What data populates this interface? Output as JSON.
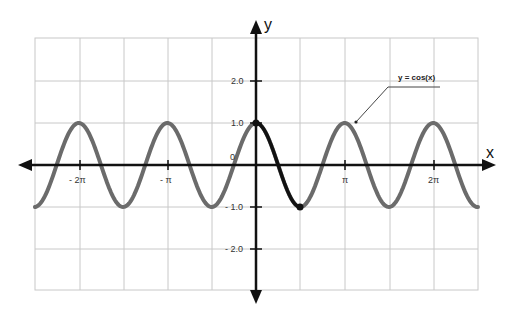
{
  "chart_data": {
    "type": "line",
    "title": "",
    "xlabel": "x",
    "ylabel": "y",
    "x_ticks": [
      "- 2π",
      "- π",
      "π",
      "2π"
    ],
    "y_ticks": [
      "2.0",
      "1.0",
      "0",
      "- 1.0",
      "- 2.0"
    ],
    "xlim_px": [
      35,
      480
    ],
    "ylim": [
      -3,
      3
    ],
    "grid": true,
    "series": [
      {
        "name": "y = cos(x)",
        "color": "#6b6b6b",
        "description": "full curve, peaks at multiples of labeled π ticks, value 1 peaks, -1 troughs"
      },
      {
        "name": "highlighted segment",
        "color": "#111111",
        "description": "from x=0 (y=1.0) to first trough (y=-1.0), endpoints marked with dots"
      }
    ],
    "annotation": "y = cos(x)"
  },
  "labels": {
    "x_axis": "x",
    "y_axis": "y",
    "origin": "0",
    "annotation": "y = cos(x)",
    "xt_m2pi": "- 2π",
    "xt_mpi": "- π",
    "xt_pi": "π",
    "xt_2pi": "2π",
    "yt_2": "2.0",
    "yt_1": "1.0",
    "yt_m1": "- 1.0",
    "yt_m2": "- 2.0"
  }
}
